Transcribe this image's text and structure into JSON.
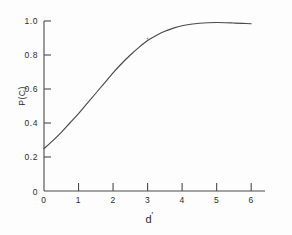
{
  "chart_data": {
    "type": "line",
    "title": "",
    "subtitle": "",
    "xlabel": "d'",
    "ylabel": "P(C)",
    "xlim": [
      0,
      6.4
    ],
    "ylim": [
      0,
      1.0
    ],
    "grid": false,
    "legend": "none",
    "x_ticks": [
      "0",
      "1",
      "2",
      "3",
      "4",
      "5",
      "6"
    ],
    "x_tick_values": [
      0,
      1,
      2,
      3,
      4,
      5,
      6
    ],
    "y_ticks": [
      "0",
      "0.2",
      "0.4",
      "0.6",
      "0.8",
      "1.0"
    ],
    "y_tick_values": [
      0,
      0.2,
      0.4,
      0.6,
      0.8,
      1.0
    ],
    "series": [
      {
        "name": "P(C) vs d'",
        "color": "#4a4a4a",
        "x": [
          0.0,
          0.25,
          0.5,
          0.75,
          1.0,
          1.25,
          1.5,
          1.75,
          2.0,
          2.25,
          2.5,
          2.75,
          3.0,
          3.25,
          3.5,
          3.75,
          4.0,
          4.25,
          4.5,
          4.75,
          5.0,
          5.25,
          5.5,
          5.75,
          6.0
        ],
        "values": [
          0.25,
          0.295,
          0.345,
          0.4,
          0.455,
          0.515,
          0.575,
          0.635,
          0.695,
          0.75,
          0.8,
          0.845,
          0.885,
          0.915,
          0.94,
          0.958,
          0.972,
          0.981,
          0.987,
          0.99,
          0.991,
          0.99,
          0.988,
          0.986,
          0.984
        ]
      }
    ],
    "annotations": [
      {
        "name": "chance-level-intercept",
        "x": 0,
        "y": 0.25,
        "text": ""
      },
      {
        "name": "plot-artifact-mark",
        "x": 3.0,
        "y": 0.915,
        "text": ""
      }
    ]
  },
  "axis": {
    "x_label_text": "d",
    "x_label_prime": "′",
    "y_label_text": "P(C)"
  }
}
